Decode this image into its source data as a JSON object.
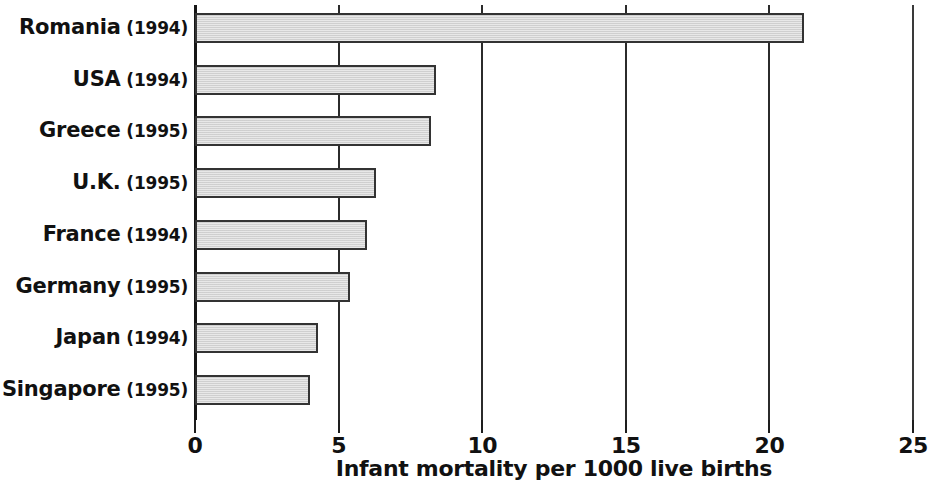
{
  "chart_data": {
    "type": "bar",
    "orientation": "horizontal",
    "title": "",
    "xlabel": "Infant mortality per 1000 live births",
    "ylabel": "",
    "xlim": [
      0,
      25
    ],
    "xticks": [
      0,
      5,
      10,
      15,
      20,
      25
    ],
    "xtick_labels": [
      "0",
      "5",
      "10",
      "15",
      "20",
      "25"
    ],
    "grid": true,
    "grid_axis": "x",
    "legend": false,
    "bar_fill_color": "#d6d6d6",
    "bar_edge_color": "#333333",
    "categories": [
      "Romania (1994)",
      "USA (1994)",
      "Greece (1995)",
      "U.K. (1995)",
      "France (1994)",
      "Germany (1995)",
      "Japan (1994)",
      "Singapore (1995)"
    ],
    "values": [
      21.2,
      8.4,
      8.2,
      6.3,
      6.0,
      5.4,
      4.3,
      4.0
    ],
    "items": [
      {
        "country": "Romania",
        "year": "(1994)",
        "value": 21.2
      },
      {
        "country": "USA",
        "year": "(1994)",
        "value": 8.4
      },
      {
        "country": "Greece",
        "year": "(1995)",
        "value": 8.2
      },
      {
        "country": "U.K.",
        "year": "(1995)",
        "value": 6.3
      },
      {
        "country": "France",
        "year": "(1994)",
        "value": 6.0
      },
      {
        "country": "Germany",
        "year": "(1995)",
        "value": 5.4
      },
      {
        "country": "Japan",
        "year": "(1994)",
        "value": 4.3
      },
      {
        "country": "Singapore",
        "year": "(1995)",
        "value": 4.0
      }
    ]
  },
  "layout": {
    "plot_left_px": 195,
    "plot_right_px": 913,
    "px_per_unit": 28.72,
    "first_bar_top_px": 13,
    "bar_height_px": 30,
    "row_pitch_px": 51.7
  }
}
